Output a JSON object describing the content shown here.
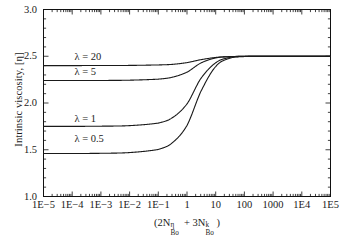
{
  "chart_data": {
    "type": "line",
    "title": "",
    "xlabel": "(2Nᴨᴮₒ + 3Nᵏᴮₒ)",
    "xlabel_parts": {
      "open": "(2N",
      "sup1": "η",
      "sub1": "Bo",
      "plus": " + 3N",
      "sup2": "k",
      "sub2": "Bo",
      "close": ")"
    },
    "ylabel": "Intrinsic viscosity, [η]",
    "xscale": "log",
    "xlim": [
      1e-05,
      100000.0
    ],
    "ylim": [
      1.0,
      3.0
    ],
    "xticks": [
      "1E−5",
      "1E−4",
      "1E−3",
      "1E−2",
      "1E−1",
      "1",
      "10",
      "100",
      "1000",
      "1E4",
      "1E5"
    ],
    "xtick_values": [
      1e-05,
      0.0001,
      0.001,
      0.01,
      0.1,
      1,
      10,
      100,
      1000,
      10000,
      100000
    ],
    "yticks": [
      "1.0",
      "1.5",
      "2.0",
      "2.5",
      "3.0"
    ],
    "ytick_values": [
      1.0,
      1.5,
      2.0,
      2.5,
      3.0
    ],
    "grid": false,
    "legend_position": "inline-curve-labels",
    "minor_ticks": true,
    "tick_direction": "in",
    "line_color": "#1a1a1a",
    "line_width": 1.1,
    "series": [
      {
        "name": "λ = 20",
        "label": "λ = 20",
        "label_x": 0.00012,
        "label_y": 2.49,
        "low_plateau": 2.4,
        "high_plateau": 2.5,
        "transition_center_log10x": 0.75,
        "transition_width_decades": 1.5,
        "points": [
          {
            "x": 1e-05,
            "y": 2.4
          },
          {
            "x": 0.0001,
            "y": 2.4
          },
          {
            "x": 0.001,
            "y": 2.401
          },
          {
            "x": 0.01,
            "y": 2.402
          },
          {
            "x": 0.1,
            "y": 2.407
          },
          {
            "x": 0.3,
            "y": 2.413
          },
          {
            "x": 1,
            "y": 2.432
          },
          {
            "x": 3,
            "y": 2.463
          },
          {
            "x": 10,
            "y": 2.487
          },
          {
            "x": 30,
            "y": 2.496
          },
          {
            "x": 100,
            "y": 2.499
          },
          {
            "x": 1000,
            "y": 2.5
          },
          {
            "x": 10000.0,
            "y": 2.5
          },
          {
            "x": 100000.0,
            "y": 2.5
          }
        ]
      },
      {
        "name": "λ = 5",
        "label": "λ = 5",
        "label_x": 0.00012,
        "label_y": 2.33,
        "low_plateau": 2.24,
        "high_plateau": 2.5,
        "transition_center_log10x": 0.7,
        "transition_width_decades": 1.4,
        "points": [
          {
            "x": 1e-05,
            "y": 2.24
          },
          {
            "x": 0.0001,
            "y": 2.24
          },
          {
            "x": 0.001,
            "y": 2.241
          },
          {
            "x": 0.01,
            "y": 2.244
          },
          {
            "x": 0.1,
            "y": 2.255
          },
          {
            "x": 0.3,
            "y": 2.275
          },
          {
            "x": 1,
            "y": 2.33
          },
          {
            "x": 3,
            "y": 2.427
          },
          {
            "x": 10,
            "y": 2.482
          },
          {
            "x": 30,
            "y": 2.496
          },
          {
            "x": 100,
            "y": 2.499
          },
          {
            "x": 1000,
            "y": 2.5
          },
          {
            "x": 10000.0,
            "y": 2.5
          },
          {
            "x": 100000.0,
            "y": 2.5
          }
        ]
      },
      {
        "name": "λ = 1",
        "label": "λ = 1",
        "label_x": 0.00012,
        "label_y": 1.83,
        "low_plateau": 1.75,
        "high_plateau": 2.5,
        "transition_center_log10x": 0.6,
        "transition_width_decades": 1.5,
        "points": [
          {
            "x": 1e-05,
            "y": 1.75
          },
          {
            "x": 0.0001,
            "y": 1.75
          },
          {
            "x": 0.001,
            "y": 1.752
          },
          {
            "x": 0.01,
            "y": 1.758
          },
          {
            "x": 0.1,
            "y": 1.785
          },
          {
            "x": 0.3,
            "y": 1.84
          },
          {
            "x": 1,
            "y": 1.99
          },
          {
            "x": 3,
            "y": 2.26
          },
          {
            "x": 10,
            "y": 2.43
          },
          {
            "x": 30,
            "y": 2.487
          },
          {
            "x": 100,
            "y": 2.498
          },
          {
            "x": 1000,
            "y": 2.5
          },
          {
            "x": 10000.0,
            "y": 2.5
          },
          {
            "x": 100000.0,
            "y": 2.5
          }
        ]
      },
      {
        "name": "λ = 0.5",
        "label": "λ = 0.5",
        "label_x": 0.00012,
        "label_y": 1.62,
        "low_plateau": 1.46,
        "high_plateau": 2.5,
        "transition_center_log10x": 0.62,
        "transition_width_decades": 1.5,
        "points": [
          {
            "x": 1e-05,
            "y": 1.46
          },
          {
            "x": 0.0001,
            "y": 1.46
          },
          {
            "x": 0.001,
            "y": 1.462
          },
          {
            "x": 0.01,
            "y": 1.47
          },
          {
            "x": 0.1,
            "y": 1.503
          },
          {
            "x": 0.3,
            "y": 1.572
          },
          {
            "x": 1,
            "y": 1.76
          },
          {
            "x": 3,
            "y": 2.12
          },
          {
            "x": 10,
            "y": 2.39
          },
          {
            "x": 30,
            "y": 2.478
          },
          {
            "x": 100,
            "y": 2.497
          },
          {
            "x": 1000,
            "y": 2.5
          },
          {
            "x": 10000.0,
            "y": 2.5
          },
          {
            "x": 100000.0,
            "y": 2.5
          }
        ]
      }
    ]
  }
}
